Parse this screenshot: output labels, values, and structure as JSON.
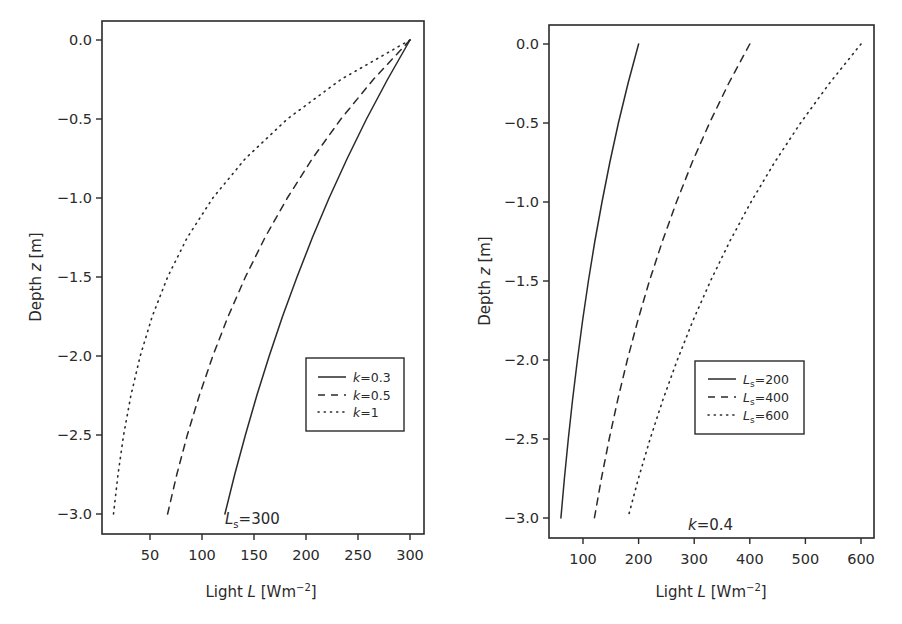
{
  "chart_data": [
    {
      "type": "line",
      "title": "",
      "xlabel": "Light L [Wm^-2]",
      "xlabel_parts": {
        "pre": "Light ",
        "var": "L",
        "post": " [Wm",
        "sup": "−2",
        "end": "]"
      },
      "ylabel": "Depth z [m]",
      "ylabel_parts": {
        "pre": "Depth ",
        "var": "z",
        "post": " [m]"
      },
      "xlim": [
        3,
        312
      ],
      "ylim": [
        -3.12,
        0.12
      ],
      "xticks": [
        50,
        100,
        150,
        200,
        250,
        300
      ],
      "xtick_labels": [
        "50",
        "100",
        "150",
        "200",
        "250",
        "300"
      ],
      "yticks": [
        0.0,
        -0.5,
        -1.0,
        -1.5,
        -2.0,
        -2.5,
        -3.0
      ],
      "ytick_labels": [
        "0.0",
        "−0.5",
        "−1.0",
        "−1.5",
        "−2.0",
        "−2.5",
        "−3.0"
      ],
      "grid": false,
      "legend_position": "lower right (inset)",
      "annotation": {
        "var": "L",
        "sub": "s",
        "text": "=300"
      },
      "model": "L = Ls * exp(k * z), Ls = 300",
      "z": [
        0.0,
        -0.25,
        -0.5,
        -0.75,
        -1.0,
        -1.25,
        -1.5,
        -1.75,
        -2.0,
        -2.25,
        -2.5,
        -2.75,
        -3.0
      ],
      "series": [
        {
          "name": "k=0.3",
          "legend_var": "k",
          "legend_text": "=0.3",
          "style": "solid",
          "values": [
            300,
            278.4,
            258.2,
            239.6,
            222.2,
            206.2,
            191.3,
            177.4,
            164.6,
            152.7,
            141.7,
            131.4,
            122.0
          ]
        },
        {
          "name": "k=0.5",
          "legend_var": "k",
          "legend_text": "=0.5",
          "style": "dashed",
          "values": [
            300,
            264.7,
            233.6,
            206.2,
            182.0,
            160.6,
            141.7,
            125.1,
            110.4,
            97.4,
            85.9,
            75.8,
            66.9
          ]
        },
        {
          "name": "k=1",
          "legend_var": "k",
          "legend_text": "=1",
          "style": "dotted",
          "values": [
            300,
            233.6,
            182.0,
            141.7,
            110.4,
            85.9,
            66.9,
            52.1,
            40.6,
            31.6,
            24.6,
            19.2,
            14.9
          ]
        }
      ]
    },
    {
      "type": "line",
      "title": "",
      "xlabel": "Light L [Wm^-2]",
      "xlabel_parts": {
        "pre": "Light ",
        "var": "L",
        "post": " [Wm",
        "sup": "−2",
        "end": "]"
      },
      "ylabel": "Depth z [m]",
      "ylabel_parts": {
        "pre": "Depth ",
        "var": "z",
        "post": " [m]"
      },
      "xlim": [
        38,
        622
      ],
      "ylim": [
        -3.12,
        0.12
      ],
      "xticks": [
        100,
        200,
        300,
        400,
        500,
        600
      ],
      "xtick_labels": [
        "100",
        "200",
        "300",
        "400",
        "500",
        "600"
      ],
      "yticks": [
        0.0,
        -0.5,
        -1.0,
        -1.5,
        -2.0,
        -2.5,
        -3.0
      ],
      "ytick_labels": [
        "0.0",
        "−0.5",
        "−1.0",
        "−1.5",
        "−2.0",
        "−2.5",
        "−3.0"
      ],
      "grid": false,
      "legend_position": "lower right (inset)",
      "annotation": {
        "var": "k",
        "sub": "",
        "text": "=0.4"
      },
      "model": "L = Ls * exp(k * z), k = 0.4",
      "z": [
        0.0,
        -0.25,
        -0.5,
        -0.75,
        -1.0,
        -1.25,
        -1.5,
        -1.75,
        -2.0,
        -2.25,
        -2.5,
        -2.75,
        -3.0
      ],
      "series": [
        {
          "name": "Ls=200",
          "legend_var": "L",
          "legend_sub": "s",
          "legend_text": "=200",
          "style": "solid",
          "values": [
            200,
            181.0,
            163.7,
            148.2,
            134.1,
            121.3,
            109.8,
            99.3,
            89.9,
            81.3,
            73.6,
            66.6,
            60.2
          ]
        },
        {
          "name": "Ls=400",
          "legend_var": "L",
          "legend_sub": "s",
          "legend_text": "=400",
          "style": "dashed",
          "values": [
            400,
            361.9,
            327.5,
            296.3,
            268.1,
            242.6,
            219.5,
            198.6,
            179.7,
            162.6,
            147.2,
            133.1,
            120.5
          ]
        },
        {
          "name": "Ls=600",
          "legend_var": "L",
          "legend_sub": "s",
          "legend_text": "=600",
          "style": "dotted",
          "values": [
            600,
            542.9,
            491.2,
            444.5,
            402.2,
            363.9,
            329.3,
            297.9,
            269.6,
            243.9,
            220.7,
            199.7,
            180.7
          ]
        }
      ]
    }
  ]
}
